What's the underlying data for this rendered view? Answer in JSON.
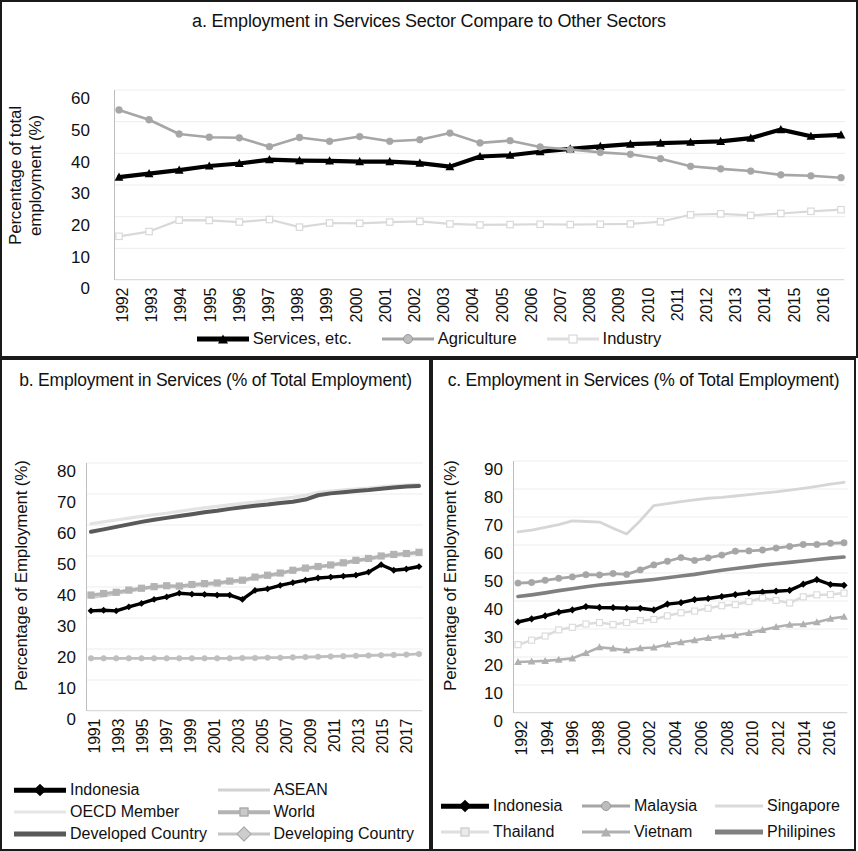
{
  "figure": {
    "background": "#ffffff",
    "panels": [
      "a",
      "b",
      "c"
    ]
  },
  "panel_a": {
    "title": "a. Employment in Services Sector Compare to Other Sectors",
    "ylabel": "Percentage of total employment (%)",
    "yticks": [
      "60",
      "50",
      "40",
      "30",
      "20",
      "10",
      "0"
    ],
    "legend": [
      "Services, etc.",
      "Agriculture",
      "Industry"
    ]
  },
  "panel_b": {
    "title": "b. Employment in Services (% of Total Employment)",
    "ylabel": "Percentage of Employment (%)",
    "yticks": [
      "80",
      "70",
      "60",
      "50",
      "40",
      "30",
      "20",
      "10",
      "0"
    ],
    "legend": [
      "Indonesia",
      "ASEAN",
      "OECD Member",
      "World",
      "Developed Country",
      "Developing Country"
    ]
  },
  "panel_c": {
    "title": "c. Employment in Services (% of Total Employment)",
    "ylabel": "Percentage of Employment (%)",
    "yticks": [
      "90",
      "80",
      "70",
      "60",
      "50",
      "40",
      "30",
      "20",
      "10",
      "0"
    ],
    "legend": [
      "Indonesia",
      "Malaysia",
      "Singapore",
      "Thailand",
      "Vietnam",
      "Philipines"
    ]
  },
  "chart_data": [
    {
      "id": "a",
      "type": "line",
      "title": "a. Employment in Services Sector Compare to Other Sectors",
      "xlabel": "",
      "ylabel": "Percentage of total employment (%)",
      "ylim": [
        0,
        60
      ],
      "ytick_step": 10,
      "grid": true,
      "legend_position": "bottom",
      "x": [
        1992,
        1993,
        1994,
        1995,
        1996,
        1997,
        1998,
        1999,
        2000,
        2001,
        2002,
        2003,
        2004,
        2005,
        2006,
        2007,
        2008,
        2009,
        2010,
        2011,
        2012,
        2013,
        2014,
        2015,
        2016
      ],
      "series": [
        {
          "name": "Services, etc.",
          "color": "#000000",
          "marker": "triangle",
          "values": [
            32.5,
            33.6,
            34.7,
            36.0,
            36.8,
            38.0,
            37.7,
            37.6,
            37.4,
            37.4,
            36.9,
            35.8,
            39.0,
            39.4,
            40.5,
            41.4,
            42.2,
            42.9,
            43.2,
            43.5,
            43.8,
            44.8,
            47.5,
            45.4,
            45.8
          ]
        },
        {
          "name": "Agriculture",
          "color": "#a6a6a6",
          "marker": "circle",
          "values": [
            53.7,
            50.6,
            46.1,
            45.1,
            44.9,
            42.1,
            45.0,
            43.8,
            45.3,
            43.8,
            44.3,
            46.4,
            43.3,
            44.0,
            42.0,
            41.2,
            40.3,
            39.7,
            38.3,
            35.9,
            35.1,
            34.4,
            33.2,
            32.9,
            32.3
          ]
        },
        {
          "name": "Industry",
          "color": "#d9d9d9",
          "marker": "square",
          "values": [
            13.8,
            15.3,
            18.9,
            18.8,
            18.3,
            19.1,
            16.7,
            18.0,
            17.9,
            18.3,
            18.5,
            17.7,
            17.4,
            17.5,
            17.6,
            17.5,
            17.6,
            17.7,
            18.4,
            20.6,
            20.9,
            20.4,
            21.0,
            21.7,
            22.2
          ]
        }
      ]
    },
    {
      "id": "b",
      "type": "line",
      "title": "b. Employment in Services (% of Total Employment)",
      "xlabel": "",
      "ylabel": "Percentage of Employment (%)",
      "ylim": [
        0,
        80
      ],
      "ytick_step": 10,
      "grid": true,
      "legend_position": "bottom",
      "x": [
        1991,
        1992,
        1993,
        1994,
        1995,
        1996,
        1997,
        1998,
        1999,
        2000,
        2001,
        2002,
        2003,
        2004,
        2005,
        2006,
        2007,
        2008,
        2009,
        2010,
        2011,
        2012,
        2013,
        2014,
        2015,
        2016,
        2017
      ],
      "xtick_labels": [
        "1991",
        "1993",
        "1995",
        "1997",
        "1999",
        "2001",
        "2003",
        "2005",
        "2007",
        "2009",
        "2011",
        "2013",
        "2015",
        "2017"
      ],
      "series": [
        {
          "name": "Indonesia",
          "color": "#000000",
          "marker": "diamond",
          "values": [
            32.3,
            32.5,
            32.3,
            33.6,
            34.7,
            36.0,
            36.8,
            38.0,
            37.7,
            37.6,
            37.4,
            37.4,
            36.0,
            38.9,
            39.4,
            40.5,
            41.4,
            42.2,
            42.9,
            43.2,
            43.5,
            43.8,
            44.8,
            47.2,
            45.4,
            45.8,
            46.6
          ]
        },
        {
          "name": "ASEAN",
          "color": "#cfcfcf",
          "marker": "none",
          "values": [
            36.6,
            37.2,
            37.8,
            38.6,
            39.3,
            39.9,
            40.2,
            39.9,
            40.4,
            40.7,
            41.0,
            41.6,
            41.8,
            42.9,
            43.5,
            44.2,
            45.2,
            45.9,
            46.4,
            46.9,
            47.5,
            48.3,
            48.9,
            49.7,
            50.2,
            50.5,
            51.0
          ]
        },
        {
          "name": "OECD Member",
          "color": "#e3e3e3",
          "marker": "none",
          "values": [
            60.4,
            61.0,
            61.6,
            62.2,
            62.8,
            63.3,
            63.8,
            64.4,
            65.0,
            65.5,
            66.0,
            66.5,
            67.0,
            67.4,
            67.9,
            68.4,
            68.9,
            69.6,
            70.5,
            70.9,
            71.3,
            71.6,
            71.9,
            72.3,
            72.6,
            72.9,
            73.1
          ]
        },
        {
          "name": "World",
          "color": "#b3b3b3",
          "marker": "square",
          "values": [
            37.4,
            37.9,
            38.3,
            39.0,
            39.6,
            40.1,
            40.4,
            40.3,
            40.8,
            41.1,
            41.3,
            41.9,
            42.2,
            43.2,
            43.8,
            44.5,
            45.4,
            46.1,
            46.6,
            47.1,
            47.8,
            48.6,
            49.2,
            50.0,
            50.5,
            50.8,
            51.2
          ]
        },
        {
          "name": "Developed Country",
          "color": "#595959",
          "marker": "none",
          "values": [
            57.8,
            58.6,
            59.4,
            60.2,
            61.0,
            61.7,
            62.3,
            62.9,
            63.5,
            64.1,
            64.6,
            65.2,
            65.7,
            66.2,
            66.6,
            67.1,
            67.5,
            68.2,
            69.6,
            70.2,
            70.6,
            71.0,
            71.3,
            71.7,
            72.1,
            72.4,
            72.6
          ]
        },
        {
          "name": "Developing Country",
          "color": "#bfbfbf",
          "marker": "circle",
          "values": [
            17.0,
            17.0,
            17.0,
            17.0,
            17.0,
            17.0,
            17.0,
            17.0,
            17.0,
            17.0,
            17.0,
            17.0,
            17.1,
            17.1,
            17.2,
            17.2,
            17.3,
            17.4,
            17.5,
            17.6,
            17.7,
            17.8,
            17.9,
            18.0,
            18.1,
            18.2,
            18.4
          ]
        }
      ]
    },
    {
      "id": "c",
      "type": "line",
      "title": "c. Employment in Services (% of Total Employment)",
      "xlabel": "",
      "ylabel": "Percentage of Employment (%)",
      "ylim": [
        0,
        90
      ],
      "ytick_step": 10,
      "grid": true,
      "legend_position": "bottom",
      "x": [
        1992,
        1993,
        1994,
        1995,
        1996,
        1997,
        1998,
        1999,
        2000,
        2001,
        2002,
        2003,
        2004,
        2005,
        2006,
        2007,
        2008,
        2009,
        2010,
        2011,
        2012,
        2013,
        2014,
        2015,
        2016
      ],
      "xtick_labels": [
        "1992",
        "1994",
        "1996",
        "1998",
        "2000",
        "2002",
        "2004",
        "2006",
        "2008",
        "2010",
        "2012",
        "2014",
        "2016"
      ],
      "series": [
        {
          "name": "Indonesia",
          "color": "#000000",
          "marker": "diamond",
          "values": [
            32.5,
            33.6,
            34.7,
            36.0,
            36.8,
            38.0,
            37.7,
            37.6,
            37.4,
            37.4,
            36.8,
            38.9,
            39.4,
            40.5,
            40.9,
            41.6,
            42.3,
            42.9,
            43.2,
            43.5,
            43.8,
            46.0,
            47.6,
            45.9,
            45.6
          ]
        },
        {
          "name": "Malaysia",
          "color": "#a6a6a6",
          "marker": "circle",
          "values": [
            46.4,
            46.6,
            47.4,
            48.1,
            48.6,
            49.4,
            49.3,
            49.8,
            49.5,
            51.1,
            52.9,
            54.2,
            55.5,
            54.5,
            55.4,
            56.4,
            57.8,
            57.9,
            58.2,
            58.9,
            59.5,
            60.2,
            60.2,
            60.6,
            60.8
          ]
        },
        {
          "name": "Singapore",
          "color": "#d6d6d6",
          "marker": "none",
          "values": [
            64.7,
            65.3,
            66.3,
            67.3,
            68.6,
            68.4,
            68.2,
            66.0,
            63.9,
            68.7,
            74.1,
            74.8,
            75.5,
            76.1,
            76.7,
            77.0,
            77.5,
            78.0,
            78.5,
            79.0,
            79.6,
            80.2,
            80.9,
            81.7,
            82.4
          ]
        },
        {
          "name": "Thailand",
          "color": "#dcdcdc",
          "marker": "square",
          "values": [
            24.4,
            26.0,
            27.5,
            29.7,
            30.6,
            31.8,
            32.3,
            31.6,
            32.3,
            33.0,
            33.4,
            34.7,
            35.8,
            36.4,
            37.4,
            38.3,
            38.7,
            39.8,
            41.1,
            40.2,
            39.3,
            41.5,
            42.2,
            42.3,
            42.8
          ]
        },
        {
          "name": "Vietnam",
          "color": "#b0b0b0",
          "marker": "triangle",
          "values": [
            18.2,
            18.4,
            18.6,
            19.0,
            19.5,
            21.4,
            23.5,
            23.0,
            22.4,
            23.1,
            23.4,
            24.5,
            25.3,
            26.0,
            26.8,
            27.3,
            27.8,
            28.6,
            29.6,
            30.7,
            31.5,
            31.7,
            32.4,
            33.7,
            34.4
          ]
        },
        {
          "name": "Philipines",
          "color": "#808080",
          "marker": "none",
          "values": [
            41.6,
            42.2,
            42.9,
            43.7,
            44.4,
            45.1,
            45.7,
            46.2,
            46.7,
            47.2,
            47.7,
            48.3,
            48.9,
            49.5,
            50.3,
            51.0,
            51.6,
            52.2,
            52.8,
            53.3,
            53.8,
            54.3,
            54.8,
            55.3,
            55.7
          ]
        }
      ]
    }
  ]
}
